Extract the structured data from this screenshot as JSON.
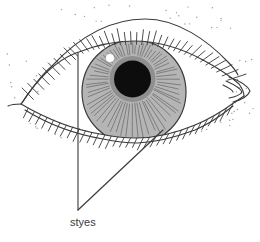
{
  "diagram": {
    "label": "styes",
    "colors": {
      "background": "#ffffff",
      "line": "#3a3a3a",
      "iris_fill": "#b5b5b5",
      "iris_lines": "#6e6e6e",
      "pupil_ring": "#8f8f8f",
      "pupil": "#0d0d0d",
      "highlight": "#ffffff",
      "stipple": "#9a9a9a"
    }
  }
}
